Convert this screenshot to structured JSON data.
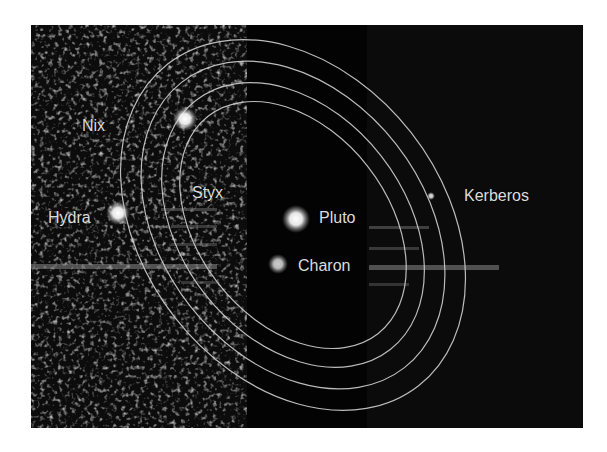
{
  "figure": {
    "background_color": "#0b0b0b",
    "orbit_color": "#c8c8c8",
    "label_color": "#dcdcdc"
  },
  "bodies": [
    {
      "name": "Pluto",
      "label": "Pluto",
      "type": "dwarf-planet",
      "x": 296,
      "y": 219
    },
    {
      "name": "Charon",
      "label": "Charon",
      "type": "moon",
      "x": 278,
      "y": 264
    },
    {
      "name": "Styx",
      "label": "Styx",
      "type": "moon",
      "x": 178,
      "y": 178
    },
    {
      "name": "Nix",
      "label": "Nix",
      "type": "moon",
      "x": 185,
      "y": 119
    },
    {
      "name": "Kerberos",
      "label": "Kerberos",
      "type": "moon",
      "x": 431,
      "y": 196
    },
    {
      "name": "Hydra",
      "label": "Hydra",
      "type": "moon",
      "x": 118,
      "y": 213
    }
  ],
  "labels": {
    "pluto": "Pluto",
    "charon": "Charon",
    "styx": "Styx",
    "nix": "Nix",
    "kerberos": "Kerberos",
    "hydra": "Hydra"
  },
  "orbits": [
    {
      "name": "styx-orbit"
    },
    {
      "name": "nix-orbit"
    },
    {
      "name": "kerberos-orbit"
    },
    {
      "name": "hydra-orbit"
    }
  ]
}
